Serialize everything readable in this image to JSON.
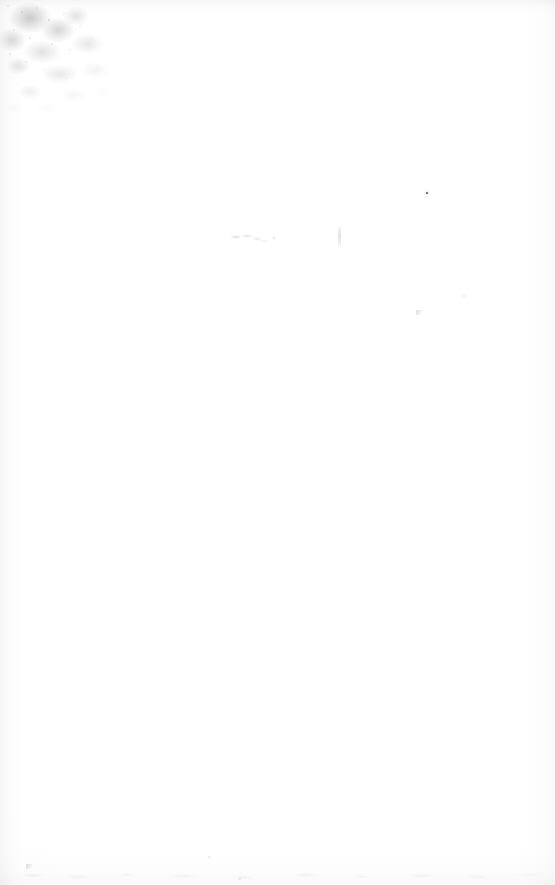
{
  "document": {
    "kind": "scanned-page",
    "page_label": "",
    "body_text": "",
    "width_px": 555,
    "height_px": 885,
    "background_color": "#ffffff",
    "description": "Blank scanned paper page with no printed text or figures"
  },
  "artifacts": {
    "stain": {
      "name": "top-left-stain",
      "label": "",
      "color": "#9a9aa0",
      "position": {
        "x": 0,
        "y": 0,
        "width": 130,
        "height": 128
      }
    },
    "marks": [
      {
        "name": "ink-smudge",
        "label": "",
        "color": "#a8a8b0",
        "type": "smudge",
        "x": 228,
        "y": 233,
        "width": 40,
        "height": 11
      },
      {
        "name": "ink-speck-small",
        "label": "",
        "color": "#b4b4bc",
        "type": "faint-dot",
        "x": 272,
        "y": 236,
        "width": 4,
        "height": 4
      },
      {
        "name": "pen-stroke",
        "label": "",
        "color": "#bcbcc2",
        "type": "stroke",
        "x": 338,
        "y": 226,
        "width": 3,
        "height": 22
      },
      {
        "name": "dark-speck",
        "label": "",
        "color": "#282830",
        "type": "speck-dark",
        "x": 426,
        "y": 192,
        "width": 2,
        "height": 2
      },
      {
        "name": "faint-spot-right",
        "label": "",
        "color": "#c4c4cc",
        "type": "faint-dot",
        "x": 462,
        "y": 294,
        "width": 4,
        "height": 4
      },
      {
        "name": "faint-spot-mid",
        "label": "",
        "color": "#c8c8d0",
        "type": "tick",
        "x": 416,
        "y": 310,
        "width": 6,
        "height": 5
      },
      {
        "name": "edge-tick-bottom",
        "label": "",
        "color": "#bdbdc4",
        "type": "tick",
        "x": 26,
        "y": 864,
        "width": 6,
        "height": 5
      },
      {
        "name": "faint-spot-lower",
        "label": "",
        "color": "#cccccf",
        "type": "faint-dot",
        "x": 207,
        "y": 855,
        "width": 4,
        "height": 4
      },
      {
        "name": "faint-spot-base",
        "label": "",
        "color": "#cfcfd4",
        "type": "faint-dot",
        "x": 238,
        "y": 877,
        "width": 4,
        "height": 4
      }
    ]
  },
  "edges": {
    "left_shadow_color": "#96969a",
    "right_shadow_color": "#a0a0a4",
    "top_shadow_color": "#9e9ea2",
    "bottom_shadow_color": "#a8a8ac"
  }
}
